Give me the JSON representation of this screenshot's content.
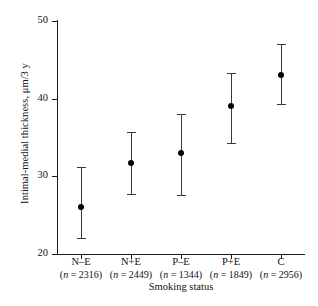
{
  "chart_data": {
    "type": "scatter",
    "title": "",
    "xlabel": "Smoking status",
    "ylabel": "Intimal-medial thickness, μm/3 y",
    "ylim": [
      20,
      50
    ],
    "yticks": [
      20,
      30,
      40,
      50
    ],
    "ytick_labels": [
      "20",
      "30",
      "40",
      "50"
    ],
    "grid": false,
    "legend": "none",
    "error_bar_style": "capped-vertical",
    "categories": [
      "N–E",
      "N+E",
      "P–E",
      "P+E",
      "C"
    ],
    "category_n_labels": [
      "(n = 2316)",
      "(n = 2449)",
      "(n = 1344)",
      "(n = 1849)",
      "(n = 2956)"
    ],
    "n_values": [
      2316,
      2449,
      1344,
      1849,
      2956
    ],
    "values": [
      26.0,
      31.7,
      33.0,
      39.0,
      43.0
    ],
    "error_low": [
      22.1,
      27.7,
      27.6,
      34.3,
      39.3
    ],
    "error_high": [
      31.2,
      35.7,
      38.0,
      43.3,
      47.0
    ],
    "points": [
      {
        "category": "N–E",
        "n_label": "(n = 2316)",
        "mean": 26.0,
        "low": 22.1,
        "high": 31.2
      },
      {
        "category": "N+E",
        "n_label": "(n = 2449)",
        "mean": 31.7,
        "low": 27.7,
        "high": 35.7
      },
      {
        "category": "P–E",
        "n_label": "(n = 1344)",
        "mean": 33.0,
        "low": 27.6,
        "high": 38.0
      },
      {
        "category": "P+E",
        "n_label": "(n = 1849)",
        "mean": 39.0,
        "low": 34.3,
        "high": 43.3
      },
      {
        "category": "C",
        "n_label": "(n = 2956)",
        "mean": 43.0,
        "low": 39.3,
        "high": 47.0
      }
    ],
    "colors": {
      "marker": "#050505",
      "whisker": "#3a3a3a",
      "axis": "#1a1a1a",
      "background": "#ffffff"
    }
  }
}
